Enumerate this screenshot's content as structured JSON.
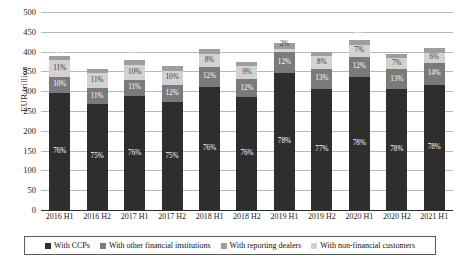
{
  "chart_data": {
    "type": "bar",
    "stacked": true,
    "title": "",
    "xlabel": "",
    "ylabel": "EUR trillion",
    "ylim": [
      0,
      500
    ],
    "ytick_step": 50,
    "yticks": [
      0,
      50,
      100,
      150,
      200,
      250,
      300,
      350,
      400,
      450,
      500
    ],
    "grid": true,
    "legend_position": "bottom",
    "categories": [
      "2016 H1",
      "2016 H2",
      "2017 H1",
      "2017 H2",
      "2018 H1",
      "2018 H2",
      "2019 H1",
      "2019 H2",
      "2020 H1",
      "2020 H2",
      "2021 H1"
    ],
    "totals": [
      390,
      357,
      378,
      363,
      410,
      375,
      443,
      400,
      430,
      395,
      408
    ],
    "series": [
      {
        "name": "With CCPs",
        "color": "#2e2e2e",
        "values": [
          76,
          75,
          76,
          75,
          76,
          76,
          78,
          77,
          78,
          78,
          78
        ],
        "labels": [
          "76%",
          "75%",
          "76%",
          "75%",
          "76%",
          "76%",
          "78%",
          "77%",
          "78%",
          "78%",
          "78%"
        ]
      },
      {
        "name": "With reporting dealers",
        "color": "#7a7a7a",
        "values": [
          10,
          11,
          11,
          12,
          12,
          12,
          12,
          13,
          12,
          13,
          14
        ],
        "labels": [
          "10%",
          "11%",
          "11%",
          "12%",
          "12%",
          "12%",
          "12%",
          "13%",
          "12%",
          "13%",
          "14%"
        ]
      },
      {
        "name": "With other financial institutions",
        "color": "#d2d2d2",
        "values": [
          11,
          11,
          10,
          10,
          8,
          9,
          2,
          8,
          7,
          7,
          6
        ],
        "labels": [
          "11%",
          "11%",
          "10%",
          "10%",
          "8%",
          "9%",
          "2%",
          "8%",
          "7%",
          "7%",
          "6%"
        ]
      },
      {
        "name": "With non-financial customers",
        "color": "#9e9e9e",
        "values": [
          3,
          3,
          3,
          3,
          3,
          3,
          3,
          3,
          3,
          3,
          3
        ],
        "labels": [
          "3%",
          "3%",
          "3%",
          "3%",
          "3%",
          "3%",
          "3%",
          "3%",
          "3%",
          "3%",
          "3%"
        ]
      }
    ]
  },
  "legend": {
    "items": [
      {
        "label": "With CCPs",
        "color": "#2e2e2e"
      },
      {
        "label": "With other financial institutions",
        "color": "#7a7a7a"
      },
      {
        "label": "With reporting dealers",
        "color": "#9e9e9e"
      },
      {
        "label": "With non-financial customers",
        "color": "#d2d2d2"
      }
    ]
  }
}
